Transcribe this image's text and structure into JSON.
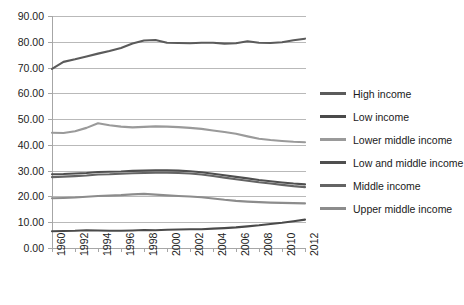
{
  "chart_data": {
    "type": "line",
    "title": "",
    "xlabel": "",
    "ylabel": "",
    "ylim": [
      0,
      90
    ],
    "ytick_labels": [
      "0.00",
      "10.00",
      "20.00",
      "30.00",
      "40.00",
      "50.00",
      "60.00",
      "70.00",
      "80.00",
      "90.00"
    ],
    "ytick_values": [
      0,
      10,
      20,
      30,
      40,
      50,
      60,
      70,
      80,
      90
    ],
    "grid": true,
    "grid_axis": "y",
    "legend_position": "right",
    "x": [
      1960,
      1991,
      1992,
      1993,
      1994,
      1995,
      1996,
      1997,
      1998,
      1999,
      2000,
      2001,
      2002,
      2003,
      2004,
      2005,
      2006,
      2007,
      2008,
      2009,
      2010,
      2011,
      2012
    ],
    "xtick_labels": [
      "1960",
      "1992",
      "1994",
      "1996",
      "1998",
      "2000",
      "2002",
      "2004",
      "2006",
      "2008",
      "2010",
      "2012"
    ],
    "xtick_positions": [
      1960,
      1992,
      1994,
      1996,
      1998,
      2000,
      2002,
      2004,
      2006,
      2008,
      2010,
      2012
    ],
    "series": [
      {
        "name": "High income",
        "color": "#5b5b5b",
        "values": [
          69.5,
          72.2,
          73.2,
          74.3,
          75.4,
          76.4,
          77.6,
          79.3,
          80.5,
          80.7,
          79.6,
          79.5,
          79.4,
          79.6,
          79.6,
          79.3,
          79.4,
          80.2,
          79.6,
          79.5,
          79.8,
          80.6,
          81.2
        ]
      },
      {
        "name": "Low income",
        "color": "#4a4a4a",
        "values": [
          6.5,
          6.6,
          6.7,
          6.9,
          6.8,
          6.7,
          6.7,
          6.8,
          7.0,
          6.9,
          7.1,
          7.2,
          7.3,
          7.3,
          7.5,
          7.7,
          8.0,
          8.4,
          8.8,
          9.3,
          9.8,
          10.4,
          11.0
        ]
      },
      {
        "name": "Lower middle income",
        "color": "#9a9a9a",
        "values": [
          44.7,
          44.6,
          45.3,
          46.6,
          48.4,
          47.6,
          47.1,
          46.8,
          47.0,
          47.2,
          47.1,
          46.9,
          46.6,
          46.2,
          45.6,
          45.0,
          44.3,
          43.3,
          42.4,
          41.9,
          41.5,
          41.2,
          41.0
        ]
      },
      {
        "name": "Low and middle income",
        "color": "#4f4f4f",
        "values": [
          28.6,
          28.7,
          28.9,
          29.1,
          29.5,
          29.6,
          29.7,
          29.9,
          30.0,
          30.1,
          30.1,
          30.0,
          29.8,
          29.4,
          28.8,
          28.2,
          27.6,
          27.0,
          26.4,
          25.9,
          25.4,
          25.0,
          24.7
        ]
      },
      {
        "name": "Middle income",
        "color": "#646464",
        "values": [
          27.5,
          27.7,
          27.9,
          28.1,
          28.5,
          28.6,
          28.8,
          29.0,
          29.1,
          29.2,
          29.2,
          29.1,
          28.9,
          28.5,
          27.9,
          27.3,
          26.7,
          26.1,
          25.5,
          25.0,
          24.5,
          24.0,
          23.6
        ]
      },
      {
        "name": "Upper middle income",
        "color": "#8c8c8c",
        "values": [
          19.3,
          19.4,
          19.6,
          19.9,
          20.2,
          20.3,
          20.5,
          20.8,
          21.0,
          20.7,
          20.4,
          20.2,
          20.0,
          19.7,
          19.2,
          18.7,
          18.3,
          18.0,
          17.8,
          17.6,
          17.5,
          17.4,
          17.3
        ]
      }
    ]
  },
  "legend": {
    "items": [
      {
        "label": "High income"
      },
      {
        "label": "Low income"
      },
      {
        "label": "Lower middle income"
      },
      {
        "label": "Low and middle income"
      },
      {
        "label": "Middle income"
      },
      {
        "label": "Upper middle income"
      }
    ]
  },
  "colors": {
    "gridline": "#b9b9b9",
    "axis": "#a6a6a6",
    "text": "#1a1a1a",
    "background": "#ffffff"
  }
}
